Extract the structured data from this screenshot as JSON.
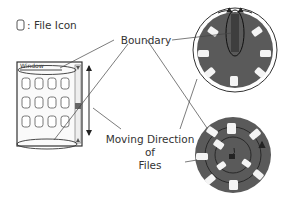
{
  "legend": {
    "icon": "file-icon",
    "separator": ":",
    "label": "File Icon"
  },
  "labels": {
    "boundary": "Boundary",
    "window": "Window",
    "moving_direction_line1": "Moving Direction",
    "moving_direction_line2": "of",
    "moving_direction_line3": "Files"
  },
  "panels": [
    {
      "name": "scrolling-window",
      "rows": 3,
      "cols": 4,
      "description": "rectangular window of file icons with vertical scroll"
    },
    {
      "name": "circular-view",
      "files": 7,
      "description": "disc with files around rim, boundary ellipse at top"
    },
    {
      "name": "spiral-view",
      "files": 11,
      "description": "disc with files arranged along a spiral path"
    }
  ],
  "colors": {
    "disc": "#5a5a5a",
    "file": "#f4f4f4",
    "line": "#333333",
    "boundary_fill": "#3e3e3e"
  }
}
